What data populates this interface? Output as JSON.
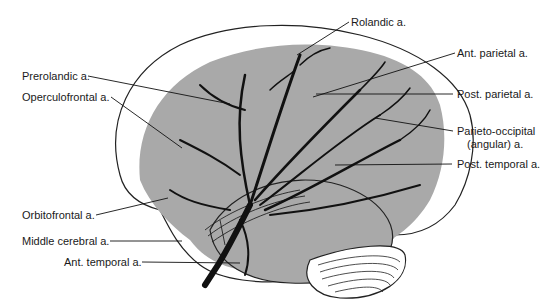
{
  "figure": {
    "colors": {
      "territory_fill": "#a9a9a9",
      "vessel": "#111111",
      "outline": "#222222",
      "background": "#ffffff"
    },
    "labels": {
      "rolandic": "Rolandic a.",
      "prerolandic": "Prerolandic a.",
      "operculofrontal": "Operculofrontal a.",
      "ant_parietal": "Ant. parietal a.",
      "post_parietal": "Post. parietal a.",
      "parieto_occipital_1": "Parieto-occipital",
      "parieto_occipital_2": "(angular) a.",
      "post_temporal": "Post. temporal a.",
      "orbitofrontal": "Orbitofrontal a.",
      "middle_cerebral": "Middle cerebral a.",
      "ant_temporal": "Ant. temporal a."
    }
  }
}
